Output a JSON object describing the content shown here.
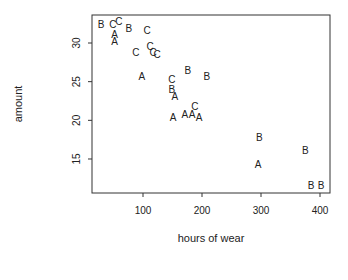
{
  "chart_data": {
    "type": "scatter",
    "title": "",
    "xlabel": "hours of wear",
    "ylabel": "amount",
    "xlim": [
      15,
      425
    ],
    "ylim": [
      10.5,
      34.5
    ],
    "xticks": [
      100,
      200,
      300,
      400
    ],
    "yticks": [
      15,
      20,
      25,
      30
    ],
    "grid": false,
    "legend": null,
    "marker_style": "letter labels (A, B, C)",
    "series": [
      {
        "name": "A",
        "points": [
          [
            52,
            31.1
          ],
          [
            52,
            30.3
          ],
          [
            98,
            25.7
          ],
          [
            154,
            23.1
          ],
          [
            151,
            20.4
          ],
          [
            171,
            20.8
          ],
          [
            183,
            20.8
          ],
          [
            195,
            20.4
          ],
          [
            295,
            14.4
          ]
        ]
      },
      {
        "name": "B",
        "points": [
          [
            29,
            32.5
          ],
          [
            76,
            32.0
          ],
          [
            149,
            24.0
          ],
          [
            176,
            26.5
          ],
          [
            208,
            25.7
          ],
          [
            297,
            17.9
          ],
          [
            375,
            16.2
          ],
          [
            385,
            11.6
          ],
          [
            402,
            11.7
          ]
        ]
      },
      {
        "name": "C",
        "points": [
          [
            49,
            32.5
          ],
          [
            59,
            32.9
          ],
          [
            107,
            31.7
          ],
          [
            88,
            28.9
          ],
          [
            112,
            29.6
          ],
          [
            117,
            28.9
          ],
          [
            124,
            28.6
          ],
          [
            149,
            25.3
          ],
          [
            188,
            21.8
          ]
        ]
      }
    ]
  }
}
